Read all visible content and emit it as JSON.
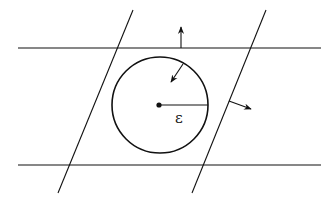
{
  "diagram": {
    "radius_label": "ε",
    "colors": {
      "stroke": "#111111",
      "background": "#ffffff"
    }
  }
}
